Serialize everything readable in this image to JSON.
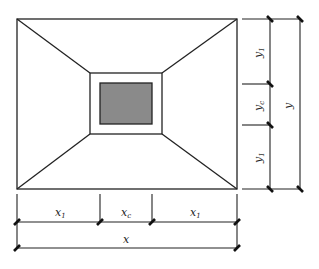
{
  "diagram": {
    "colors": {
      "stroke": "#222222",
      "column_fill": "#8a8a8a",
      "background": "#ffffff"
    },
    "labels": {
      "x1_left": {
        "base": "x",
        "sub": "1"
      },
      "xc": {
        "base": "x",
        "sub": "c"
      },
      "x1_right": {
        "base": "x",
        "sub": "1"
      },
      "x": {
        "base": "x"
      },
      "y1_top": {
        "base": "y",
        "sub": "1"
      },
      "yc": {
        "base": "y",
        "sub": "c"
      },
      "y1_bottom": {
        "base": "y",
        "sub": "1"
      },
      "y": {
        "base": "y"
      }
    }
  }
}
